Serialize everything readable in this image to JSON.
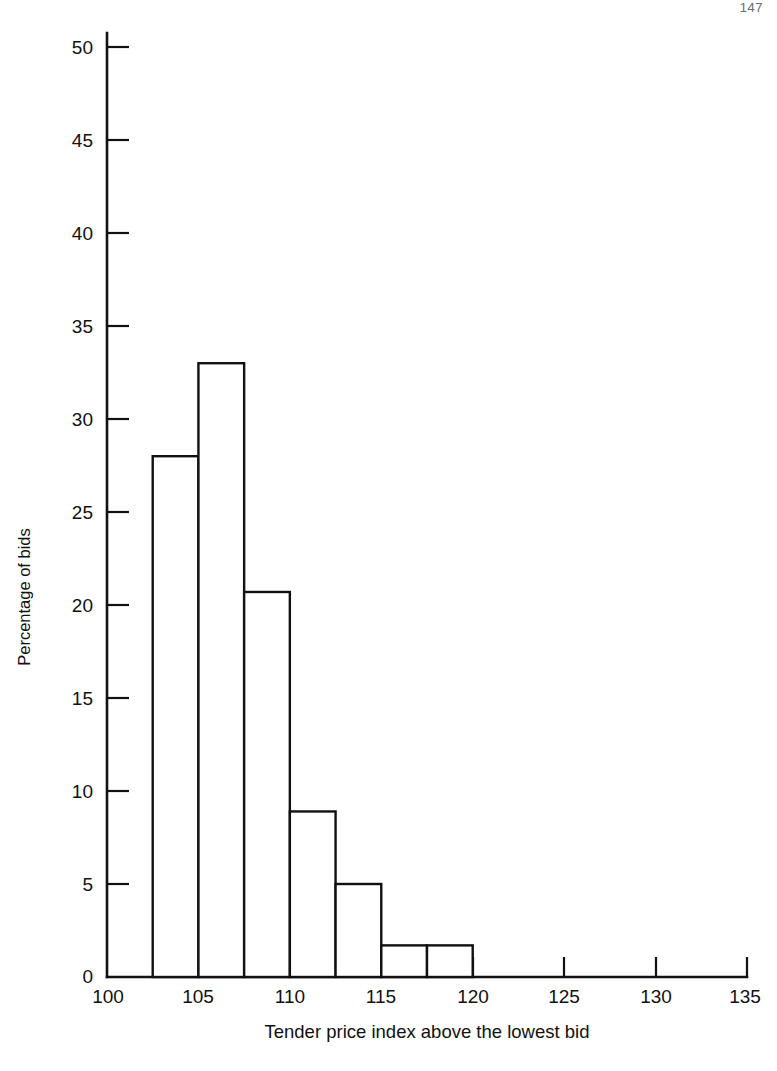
{
  "page": {
    "number": "147"
  },
  "chart_data": {
    "type": "bar",
    "title": "",
    "subtitle": "",
    "xlabel": "Tender price index above the lowest bid",
    "ylabel": "Percentage of bids",
    "xlim": [
      100,
      135
    ],
    "ylim": [
      0,
      50
    ],
    "xticks": [
      100,
      105,
      110,
      115,
      120,
      125,
      130,
      135
    ],
    "xtick_labels": [
      "100",
      "105",
      "110",
      "115",
      "120",
      "125",
      "130",
      "135"
    ],
    "yticks": [
      0,
      5,
      10,
      15,
      20,
      25,
      30,
      35,
      40,
      45,
      50
    ],
    "ytick_labels": [
      "0",
      "5",
      "10",
      "15",
      "20",
      "25",
      "30",
      "35",
      "40",
      "45",
      "50"
    ],
    "grid": false,
    "legend": "none",
    "bin_width": 2.5,
    "bins": [
      {
        "start": 102.5,
        "end": 105.0,
        "value": 28.0
      },
      {
        "start": 105.0,
        "end": 107.5,
        "value": 33.0
      },
      {
        "start": 107.5,
        "end": 110.0,
        "value": 20.7
      },
      {
        "start": 110.0,
        "end": 112.5,
        "value": 8.9
      },
      {
        "start": 112.5,
        "end": 115.0,
        "value": 5.0
      },
      {
        "start": 115.0,
        "end": 117.5,
        "value": 1.7
      },
      {
        "start": 117.5,
        "end": 120.0,
        "value": 1.7
      }
    ],
    "categories": [
      "102.5-105",
      "105-107.5",
      "107.5-110",
      "110-112.5",
      "112.5-115",
      "115-117.5",
      "117.5-120"
    ],
    "values": [
      28.0,
      33.0,
      20.7,
      8.9,
      5.0,
      1.7,
      1.7
    ],
    "colors": {
      "bar_fill": "#ffffff",
      "bar_stroke": "#111111",
      "axis": "#111111",
      "background": "#ffffff"
    }
  }
}
